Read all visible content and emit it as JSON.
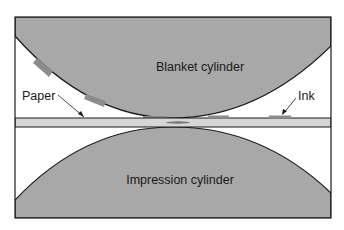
{
  "diagram": {
    "labels": {
      "blanket": "Blanket cylinder",
      "impression": "Impression cylinder",
      "paper": "Paper",
      "ink": "Ink"
    },
    "colors": {
      "cylinder_fill": "#a8a8a8",
      "paper_fill": "#d6d6d6",
      "ink_fill": "#8c8c8c",
      "outline": "#1a1a1a",
      "background": "#ffffff"
    }
  }
}
